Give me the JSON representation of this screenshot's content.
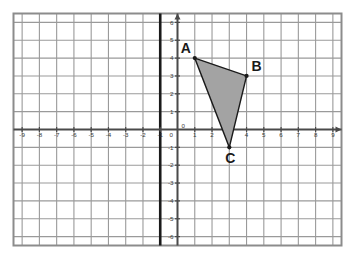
{
  "figure": {
    "title": "",
    "background_color": "#ffffff",
    "frame_color": "#8c8c8c",
    "grid_color": "#9a9a9a",
    "axis_color": "#4a4a4a"
  },
  "chart_data": {
    "type": "scatter",
    "title": "",
    "xlabel": "",
    "ylabel": "",
    "xlim": [
      -9.5,
      9.5
    ],
    "ylim": [
      -6.5,
      6.5
    ],
    "grid": true,
    "legend": "none",
    "x_ticks": [
      -9,
      -8,
      -7,
      -6,
      -5,
      -4,
      -3,
      -2,
      -1,
      0,
      1,
      2,
      3,
      4,
      5,
      6,
      7,
      8,
      9
    ],
    "x_tick_labels": [
      "-9",
      "-8",
      "-7",
      "-6",
      "-5",
      "-4",
      "-3",
      "-2",
      "-1",
      "0",
      "1",
      "2",
      "3",
      "4",
      "5",
      "6",
      "7",
      "8",
      "9"
    ],
    "y_ticks": [
      -6,
      -5,
      -4,
      -3,
      -2,
      -1,
      0,
      1,
      2,
      3,
      4,
      5,
      6
    ],
    "y_tick_labels": [
      "-6",
      "-5",
      "-4",
      "-3",
      "-2",
      "-1",
      "0",
      "1",
      "2",
      "3",
      "4",
      "5",
      "6"
    ],
    "series": [
      {
        "name": "Triangle ABC",
        "type": "polygon",
        "fill_color": "#a3a3a3",
        "edge_color": "#1a1a1a",
        "points": [
          {
            "label": "A",
            "x": 1,
            "y": 4
          },
          {
            "label": "B",
            "x": 4,
            "y": 3
          },
          {
            "label": "C",
            "x": 3,
            "y": -1
          }
        ]
      }
    ],
    "annotations": [
      {
        "text": "A",
        "x": 1,
        "y": 4,
        "position": "above-left"
      },
      {
        "text": "B",
        "x": 4,
        "y": 3,
        "position": "above-right"
      },
      {
        "text": "C",
        "x": 3,
        "y": -1,
        "position": "below"
      }
    ],
    "reference_lines": [
      {
        "orientation": "vertical",
        "x": -1,
        "color": "#1a1a1a",
        "width": 2.6
      }
    ]
  },
  "labels": {
    "vertex_a": "A",
    "vertex_b": "B",
    "vertex_c": "C"
  }
}
